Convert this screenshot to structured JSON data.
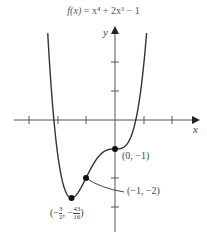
{
  "title": {
    "function_name": "f(x)",
    "equals": "=",
    "expression": "x⁴ + 2x³ − 1"
  },
  "axes": {
    "x_label": "x",
    "y_label": "y"
  },
  "points": [
    {
      "label": "(0, −1)",
      "x": 0,
      "y": -1
    },
    {
      "label": "(−1, −2)",
      "x": -1,
      "y": -2
    },
    {
      "label": "(−3/2, −43/16)",
      "x": -1.5,
      "y": -2.6875
    }
  ],
  "chart_data": {
    "type": "line",
    "title": "f(x) = x⁴ + 2x³ − 1",
    "xlabel": "x",
    "ylabel": "y",
    "function": "x^4 + 2x^3 - 1",
    "xlim": [
      -3.5,
      3
    ],
    "ylim": [
      -3.2,
      3.2
    ],
    "x_ticks": [
      -3,
      -2,
      -1,
      1,
      2
    ],
    "y_ticks": [
      -3,
      -2,
      -1,
      1,
      2
    ],
    "grid": false,
    "annotated_points": [
      {
        "label": "(0, −1)",
        "x": 0,
        "y": -1
      },
      {
        "label": "(−1, −2)",
        "x": -1,
        "y": -2
      },
      {
        "label": "(−3/2, −43/16)",
        "x": -1.5,
        "y": -2.6875
      }
    ]
  }
}
